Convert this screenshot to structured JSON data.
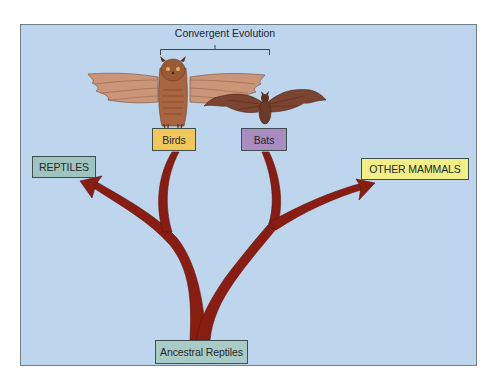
{
  "diagram": {
    "title": "Convergent Evolution",
    "colors": {
      "background": "#bed5ee",
      "branch": "#8a1d12",
      "reptiles_box": "#9fc4c0",
      "ancestral_box": "#a9cbc6",
      "birds_box": "#f2c75a",
      "bats_box": "#a98cc2",
      "other_mammals_box": "#f3ef86"
    },
    "nodes": {
      "root": {
        "label": "Ancestral Reptiles"
      },
      "reptiles": {
        "label": "REPTILES"
      },
      "birds": {
        "label": "Birds",
        "illustration": "owl-icon"
      },
      "bats": {
        "label": "Bats",
        "illustration": "bat-icon"
      },
      "other_mammals": {
        "label": "OTHER MAMMALS"
      }
    },
    "edges": [
      {
        "from": "Ancestral Reptiles",
        "to": "REPTILES"
      },
      {
        "from": "Ancestral Reptiles",
        "to": "Birds"
      },
      {
        "from": "Ancestral Reptiles",
        "to": "Bats"
      },
      {
        "from": "Ancestral Reptiles",
        "to": "OTHER MAMMALS"
      }
    ],
    "bracket": {
      "label": "Convergent Evolution",
      "spans": [
        "Birds",
        "Bats"
      ]
    }
  }
}
